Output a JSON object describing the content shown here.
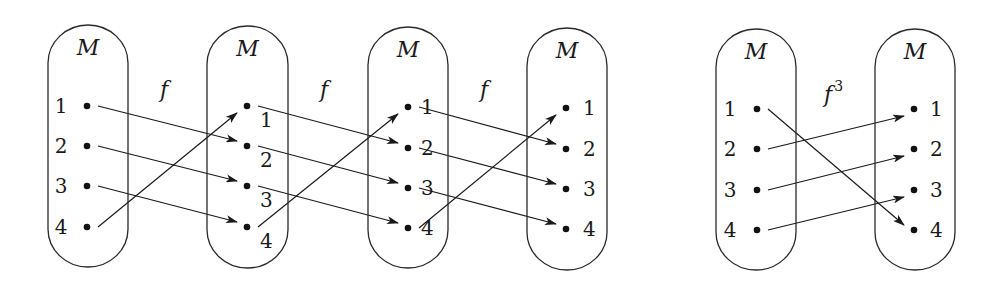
{
  "diagram": {
    "colors": {
      "stroke": "#1a1a1a",
      "background": "#ffffff"
    },
    "sets": [
      {
        "id": "M0",
        "name": "M",
        "x": 48,
        "y": 25,
        "w": 80,
        "h": 242,
        "dot_x": 87,
        "label_x": 61,
        "label_side": "left",
        "label_dy": 7,
        "ys": [
          106,
          146,
          186,
          227
        ],
        "elements": [
          "1",
          "2",
          "3",
          "4"
        ]
      },
      {
        "id": "M1",
        "name": "M",
        "x": 207,
        "y": 26,
        "w": 81,
        "h": 242,
        "dot_x": 247,
        "label_x": 260,
        "label_side": "right",
        "label_dy": 21,
        "ys": [
          106,
          146,
          186,
          227
        ],
        "elements": [
          "1",
          "2",
          "3",
          "4"
        ]
      },
      {
        "id": "M2",
        "name": "M",
        "x": 368,
        "y": 27,
        "w": 80,
        "h": 241,
        "dot_x": 408,
        "label_x": 421,
        "label_side": "right",
        "label_dy": 7,
        "ys": [
          107,
          148,
          188,
          228
        ],
        "elements": [
          "1",
          "2",
          "3",
          "4"
        ]
      },
      {
        "id": "M3",
        "name": "M",
        "x": 527,
        "y": 28,
        "w": 80,
        "h": 242,
        "dot_x": 566,
        "label_x": 583,
        "label_side": "right",
        "label_dy": 7,
        "ys": [
          108,
          149,
          189,
          229
        ],
        "elements": [
          "1",
          "2",
          "3",
          "4"
        ]
      },
      {
        "id": "M4",
        "name": "M",
        "x": 716,
        "y": 29,
        "w": 80,
        "h": 241,
        "dot_x": 757,
        "label_x": 730,
        "label_side": "left",
        "label_dy": 7,
        "ys": [
          109,
          149,
          190,
          230
        ],
        "elements": [
          "1",
          "2",
          "3",
          "4"
        ]
      },
      {
        "id": "M5",
        "name": "M",
        "x": 875,
        "y": 29,
        "w": 80,
        "h": 241,
        "dot_x": 914,
        "label_x": 930,
        "label_side": "right",
        "label_dy": 7,
        "ys": [
          109,
          149,
          190,
          230
        ],
        "elements": [
          "1",
          "2",
          "3",
          "4"
        ]
      }
    ],
    "mappings": [
      {
        "id": "f1",
        "label": "f",
        "sup": "",
        "from": 0,
        "to": 1,
        "label_x": 160,
        "label_y": 97,
        "pairs": [
          [
            1,
            2
          ],
          [
            2,
            3
          ],
          [
            3,
            4
          ],
          [
            4,
            1
          ]
        ]
      },
      {
        "id": "f2",
        "label": "f",
        "sup": "",
        "from": 1,
        "to": 2,
        "label_x": 320,
        "label_y": 97,
        "pairs": [
          [
            1,
            2
          ],
          [
            2,
            3
          ],
          [
            3,
            4
          ],
          [
            4,
            1
          ]
        ]
      },
      {
        "id": "f3",
        "label": "f",
        "sup": "",
        "from": 2,
        "to": 3,
        "label_x": 480,
        "label_y": 97,
        "pairs": [
          [
            1,
            2
          ],
          [
            2,
            3
          ],
          [
            3,
            4
          ],
          [
            4,
            1
          ]
        ]
      },
      {
        "id": "f_cubed",
        "label": "f",
        "sup": "3",
        "from": 4,
        "to": 5,
        "label_x": 824,
        "label_y": 102,
        "pairs": [
          [
            1,
            4
          ],
          [
            2,
            1
          ],
          [
            3,
            2
          ],
          [
            4,
            3
          ]
        ]
      }
    ]
  }
}
